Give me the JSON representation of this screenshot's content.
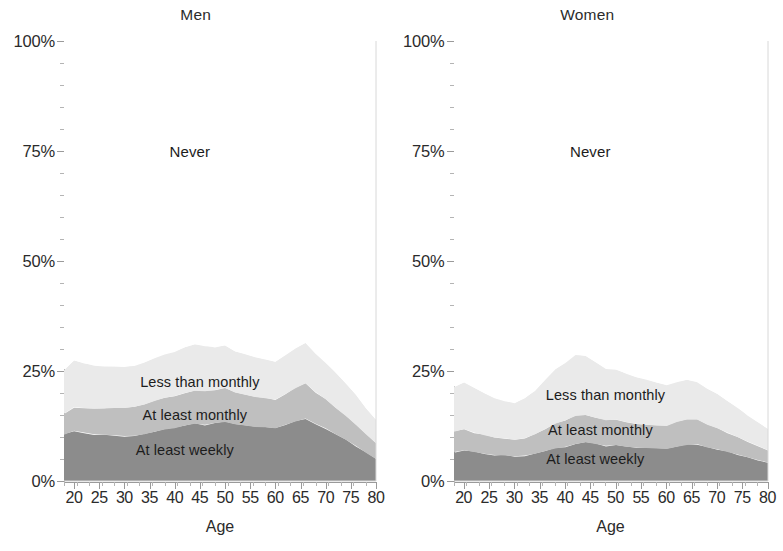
{
  "figure": {
    "axis_title_x": "Age",
    "y_tick_labels": [
      "0%",
      "25%",
      "50%",
      "75%",
      "100%"
    ],
    "y_tick_values": [
      0,
      25,
      50,
      75,
      100
    ],
    "x_tick_labels": [
      "20",
      "25",
      "30",
      "35",
      "40",
      "45",
      "50",
      "55",
      "60",
      "65",
      "70",
      "75",
      "80"
    ],
    "x_tick_values": [
      20,
      25,
      30,
      35,
      40,
      45,
      50,
      55,
      60,
      65,
      70,
      75,
      80
    ],
    "colors": {
      "at_least_weekly": "#8c8c8c",
      "at_least_monthly": "#bfbfbf",
      "less_than_monthly": "#eaeaea",
      "never": "#ffffff",
      "axis": "#9a9a9a",
      "text": "#2b2b2b"
    }
  },
  "panels": [
    {
      "title": "Men",
      "labels": {
        "never": "Never",
        "less_than_monthly": "Less than monthly",
        "at_least_monthly": "At least monthly",
        "at_least_weekly": "At least weekly"
      },
      "label_positions": {
        "never": {
          "x": 43,
          "y": 75
        },
        "less_than_monthly": {
          "x": 45,
          "y": 22.5
        },
        "at_least_monthly": {
          "x": 44,
          "y": 15.0
        },
        "at_least_weekly": {
          "x": 42,
          "y": 7.0
        }
      }
    },
    {
      "title": "Women",
      "labels": {
        "never": "Never",
        "less_than_monthly": "Less than monthly",
        "at_least_monthly": "At least monthly",
        "at_least_weekly": "At least weekly"
      },
      "label_positions": {
        "never": {
          "x": 45,
          "y": 75
        },
        "less_than_monthly": {
          "x": 48,
          "y": 19.5
        },
        "at_least_monthly": {
          "x": 47,
          "y": 11.5
        },
        "at_least_weekly": {
          "x": 46,
          "y": 5.0
        }
      }
    }
  ],
  "chart_data": {
    "type": "area",
    "title": "",
    "xlabel": "Age",
    "ylabel": "",
    "xlim": [
      18,
      80
    ],
    "ylim": [
      0,
      100
    ],
    "grid": false,
    "legend_position": "in-plot labels",
    "stacked": true,
    "stack_order_bottom_to_top": [
      "At least weekly",
      "At least monthly",
      "Less than monthly",
      "Never"
    ],
    "panels": [
      {
        "panel": "Men",
        "x": [
          18,
          20,
          22,
          24,
          26,
          28,
          30,
          32,
          34,
          36,
          38,
          40,
          42,
          44,
          46,
          48,
          50,
          52,
          54,
          56,
          58,
          60,
          62,
          64,
          66,
          68,
          70,
          72,
          74,
          76,
          78,
          80
        ],
        "series": [
          {
            "name": "At least weekly",
            "values": [
              10.5,
              11.4,
              11.0,
              10.6,
              10.5,
              10.4,
              10.2,
              10.3,
              10.6,
              11.2,
              11.7,
              12.0,
              12.6,
              13.0,
              12.8,
              13.2,
              13.4,
              12.9,
              12.6,
              12.3,
              12.2,
              12.0,
              12.8,
              13.5,
              14.2,
              13.0,
              12.0,
              10.6,
              9.4,
              8.0,
              6.4,
              5.0
            ]
          },
          {
            "name": "At least monthly",
            "values": [
              4.8,
              5.4,
              5.6,
              5.8,
              6.0,
              6.2,
              6.4,
              6.6,
              6.8,
              7.0,
              7.2,
              7.3,
              7.4,
              7.5,
              7.6,
              7.5,
              7.8,
              7.2,
              7.0,
              6.8,
              6.6,
              6.5,
              7.0,
              7.6,
              8.0,
              7.2,
              6.6,
              6.0,
              5.4,
              4.8,
              4.2,
              3.6
            ]
          },
          {
            "name": "Less than monthly",
            "values": [
              10.0,
              10.6,
              10.2,
              9.8,
              9.5,
              9.4,
              9.3,
              9.4,
              9.6,
              9.8,
              10.0,
              10.2,
              10.4,
              10.6,
              10.2,
              9.8,
              9.6,
              9.4,
              9.2,
              9.0,
              8.8,
              8.6,
              8.8,
              9.0,
              9.2,
              8.8,
              8.4,
              8.0,
              7.4,
              6.8,
              6.0,
              5.4
            ]
          },
          {
            "name": "Never",
            "values": [
              74.7,
              72.6,
              73.2,
              73.8,
              74.0,
              74.0,
              74.1,
              73.7,
              73.0,
              72.0,
              71.1,
              70.5,
              69.6,
              68.9,
              69.4,
              69.5,
              69.2,
              70.5,
              71.2,
              71.9,
              72.4,
              72.9,
              71.4,
              69.9,
              68.6,
              71.0,
              73.0,
              75.4,
              77.8,
              80.4,
              83.4,
              86.0
            ]
          }
        ]
      },
      {
        "panel": "Women",
        "x": [
          18,
          20,
          22,
          24,
          26,
          28,
          30,
          32,
          34,
          36,
          38,
          40,
          42,
          44,
          46,
          48,
          50,
          52,
          54,
          56,
          58,
          60,
          62,
          64,
          66,
          68,
          70,
          72,
          74,
          76,
          78,
          80
        ],
        "series": [
          {
            "name": "At least weekly",
            "values": [
              6.6,
              7.0,
              6.6,
              6.2,
              5.9,
              5.8,
              5.6,
              5.8,
              6.2,
              6.8,
              7.4,
              7.8,
              8.4,
              8.8,
              8.4,
              8.0,
              8.2,
              7.8,
              7.6,
              7.5,
              7.4,
              7.3,
              7.8,
              8.2,
              8.4,
              7.6,
              7.2,
              6.6,
              6.0,
              5.4,
              4.8,
              4.2
            ]
          },
          {
            "name": "At least monthly",
            "values": [
              4.6,
              4.8,
              4.4,
              4.2,
              4.0,
              3.9,
              3.8,
              4.0,
              4.4,
              5.0,
              5.6,
              6.0,
              6.4,
              6.2,
              6.0,
              5.8,
              5.8,
              5.6,
              5.4,
              5.3,
              5.2,
              5.2,
              5.6,
              5.8,
              5.6,
              5.2,
              4.8,
              4.4,
              4.0,
              3.6,
              3.2,
              2.8
            ]
          },
          {
            "name": "Less than monthly",
            "values": [
              10.2,
              10.6,
              10.2,
              9.6,
              9.0,
              8.6,
              8.4,
              9.0,
              10.0,
              11.2,
              12.4,
              13.2,
              14.0,
              13.4,
              12.6,
              11.8,
              11.4,
              11.0,
              10.6,
              10.2,
              9.8,
              9.4,
              9.2,
              9.0,
              8.6,
              8.2,
              7.8,
              7.2,
              6.6,
              6.0,
              5.4,
              4.8
            ]
          },
          {
            "name": "Never",
            "values": [
              78.6,
              77.6,
              78.8,
              80.0,
              81.1,
              81.7,
              82.2,
              81.2,
              79.4,
              77.0,
              74.6,
              73.0,
              71.2,
              71.6,
              73.0,
              74.4,
              74.6,
              75.6,
              76.4,
              77.0,
              77.6,
              78.1,
              77.4,
              77.0,
              77.4,
              79.0,
              80.2,
              81.8,
              83.4,
              85.0,
              86.6,
              88.2
            ]
          }
        ]
      }
    ]
  }
}
